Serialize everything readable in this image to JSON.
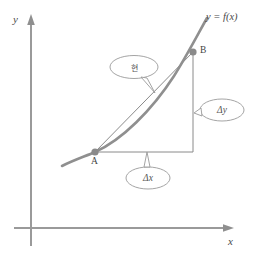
{
  "figure": {
    "type": "calculus-secant-diagram",
    "background": "#ffffff",
    "stroke_color": "#8a8a8a",
    "curve_color": "#8f8f8f",
    "axis_color": "#9a9a9a",
    "text_color": "#4a4a4a",
    "point_color": "#8a8a8a",
    "width": 255,
    "height": 268
  },
  "axes": {
    "y_label": "y",
    "x_label": "x",
    "origin_x": 31,
    "origin_y": 228
  },
  "function_label": "y = f(x)",
  "points": [
    {
      "name": "A",
      "label": "A",
      "x": 95,
      "y": 152
    },
    {
      "name": "B",
      "label": "B",
      "x": 193,
      "y": 52
    }
  ],
  "callouts": [
    {
      "name": "chord",
      "label": "현",
      "meaning": "chord-secant-line",
      "cx": 134,
      "cy": 67
    },
    {
      "name": "delta-y",
      "label": "Δy",
      "cx": 222,
      "cy": 110
    },
    {
      "name": "delta-x",
      "label": "Δx",
      "cx": 148,
      "cy": 178
    }
  ],
  "segments": {
    "secant": {
      "from": "A",
      "to": "B"
    },
    "vertical_leg": {
      "label": "Δy"
    },
    "horizontal_leg": {
      "label": "Δx"
    },
    "corner": {
      "x": 193,
      "y": 152
    }
  }
}
